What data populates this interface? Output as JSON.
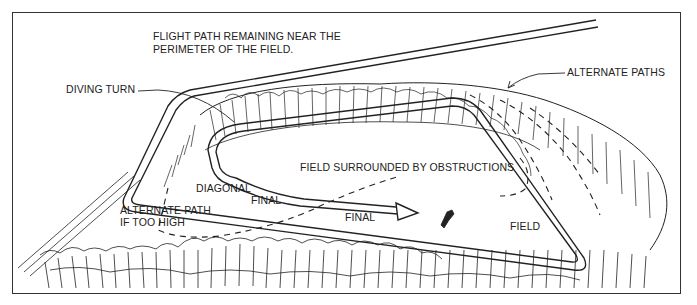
{
  "figure": {
    "title_lines": [
      "FLIGHT PATH REMAINING NEAR THE",
      "PERIMETER OF THE FIELD."
    ],
    "labels": {
      "diving_turn": "DIVING TURN",
      "alternate_paths": "ALTERNATE PATHS",
      "field_surrounded": "FIELD SURROUNDED BY OBSTRUCTIONS",
      "diagonal_final_1": "DIAGONAL",
      "diagonal_final_2": "FINAL",
      "alternate_path_1": "ALTERNATE PATH",
      "alternate_path_2": "IF TOO HIGH",
      "final": "FINAL",
      "field": "FIELD"
    },
    "colors": {
      "ink": "#222222",
      "background": "#ffffff"
    }
  }
}
